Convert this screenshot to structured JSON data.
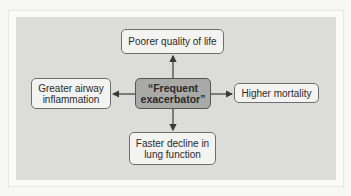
{
  "diagram": {
    "center": {
      "line1": "“Frequent",
      "line2": "exacerbator”"
    },
    "top": {
      "line1": "Poorer quality of life"
    },
    "left": {
      "line1": "Greater airway",
      "line2": "inflammation"
    },
    "right": {
      "line1": "Higher mortality"
    },
    "bottom": {
      "line1": "Faster decline in",
      "line2": "lung function"
    },
    "colors": {
      "panel": "#dcdcdb",
      "center_fill": "#a9a9a8",
      "node_fill": "#f3f3f2",
      "arrow": "#3a3a3a"
    }
  }
}
